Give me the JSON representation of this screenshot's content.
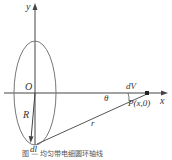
{
  "figure": {
    "labels": {
      "y_axis": "y",
      "x_axis": "x",
      "origin": "O",
      "radius": "R",
      "distance": "r",
      "angle": "θ",
      "volume_element": "dV",
      "point": "P(x,0)",
      "line_element": "dl"
    },
    "caption": "图 — 均匀带电细圆环轴线"
  }
}
